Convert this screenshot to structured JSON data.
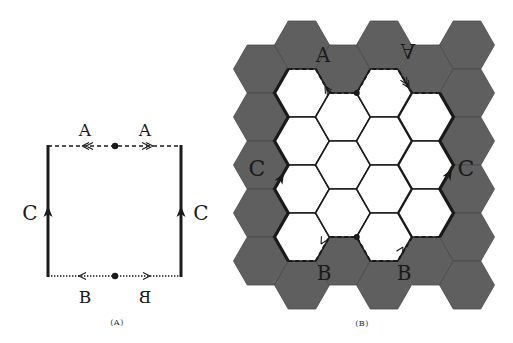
{
  "panels": {
    "a": {
      "caption": "(A)",
      "labels": {
        "top_left": "A",
        "top_right": "A",
        "bottom_left": "B",
        "bottom_right": "B",
        "left": "C",
        "right": "C"
      },
      "square": {
        "x1": 48,
        "y1": 146,
        "x2": 181,
        "y2": 276
      },
      "edges": {
        "top": "dashed, double-chevron arrows pointing outward from center dot",
        "bottom": "dotted, single arrows pointing outward from center dot",
        "left": "solid thick, arrow up",
        "right": "solid thick, arrow up"
      }
    },
    "b": {
      "caption": "(B)",
      "labels": {
        "top_left": "A",
        "top_right": "A",
        "bottom_left": "B",
        "bottom_right": "B",
        "left": "C",
        "right": "C"
      },
      "hex_grid": {
        "columns": 6,
        "hex_radius": 27.5,
        "column_centers_x": [
          261,
          302,
          343,
          384,
          426,
          467
        ],
        "white_cells": [
          {
            "col": 1,
            "rows_cy": [
              93,
              141,
              189,
              237
            ]
          },
          {
            "col": 2,
            "rows_cy": [
              117,
              165,
              213
            ]
          },
          {
            "col": 3,
            "rows_cy": [
              93,
              141,
              189,
              237
            ]
          },
          {
            "col": 4,
            "rows_cy": [
              117,
              165,
              213
            ]
          }
        ]
      }
    }
  },
  "colors": {
    "gray_hex": "#5f5f5f",
    "gray_hex_edge": "#4a4a4a",
    "line": "#1a1a1a",
    "white_hex": "#ffffff"
  }
}
